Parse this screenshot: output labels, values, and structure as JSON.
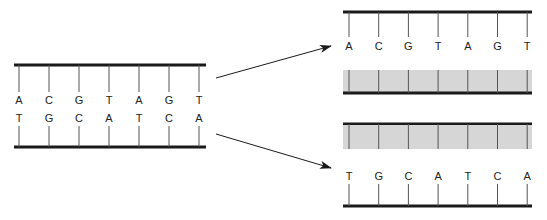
{
  "diagram": {
    "parent": {
      "top_strand": [
        "A",
        "C",
        "G",
        "T",
        "A",
        "G",
        "T"
      ],
      "bottom_strand": [
        "T",
        "G",
        "C",
        "A",
        "T",
        "C",
        "A"
      ]
    },
    "daughter_top": {
      "strand": [
        "A",
        "C",
        "G",
        "T",
        "A",
        "G",
        "T"
      ],
      "new_strand": "shaded"
    },
    "daughter_bottom": {
      "strand": [
        "T",
        "G",
        "C",
        "A",
        "T",
        "C",
        "A"
      ],
      "new_strand": "shaded"
    },
    "colors": {
      "backbone": "#1a1a1a",
      "rung": "#555555",
      "shade": "#d6d6d6"
    }
  }
}
